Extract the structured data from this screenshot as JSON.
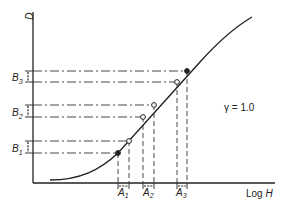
{
  "diagram": {
    "y_axis_label": "D",
    "x_axis_label_prefix": "Log ",
    "x_axis_label_var": "H",
    "gamma_label": "γ = 1.0",
    "gamma_value": 1.0,
    "b_labels": [
      {
        "letter": "B",
        "sub": "1"
      },
      {
        "letter": "B",
        "sub": "2"
      },
      {
        "letter": "B",
        "sub": "3"
      }
    ],
    "a_labels": [
      {
        "letter": "A",
        "sub": "1"
      },
      {
        "letter": "A",
        "sub": "2"
      },
      {
        "letter": "A",
        "sub": "3"
      }
    ],
    "marker_pairs": [
      {
        "name": "A1-B1",
        "low": {
          "fill": "filled"
        },
        "high": {
          "fill": "open"
        }
      },
      {
        "name": "A2-B2",
        "low": {
          "fill": "open"
        },
        "high": {
          "fill": "open"
        }
      },
      {
        "name": "A3-B3",
        "low": {
          "fill": "open"
        },
        "high": {
          "fill": "filled"
        }
      }
    ],
    "colors": {
      "ink": "#222222",
      "background": "#ffffff"
    }
  }
}
